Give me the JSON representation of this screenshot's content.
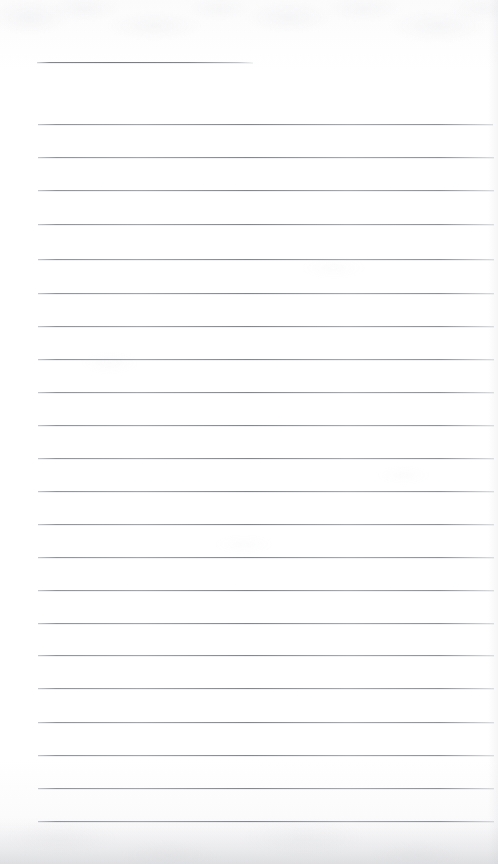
{
  "page": {
    "title": "Blank Lined Notebook Page",
    "kind": "scanned-document",
    "width": 498,
    "height": 864,
    "background_color": "#fefefe",
    "rule_color": "#84888f",
    "shadow_color": "#c4c6cb",
    "text_content": "",
    "note": "Blank ruled page. No written text, headings, numbers, or annotations are visible."
  },
  "layout": {
    "left_margin_x": 38,
    "right_margin_x": 493,
    "line_spacing": 33.2
  },
  "rules": [
    {
      "name": "header-rule",
      "y": 62,
      "x_start": 37,
      "x_end": 253,
      "full_width": false
    },
    {
      "name": "rule-01",
      "y": 124,
      "x_start": 38,
      "x_end": 493,
      "full_width": true
    },
    {
      "name": "rule-02",
      "y": 157,
      "x_start": 38,
      "x_end": 494,
      "full_width": true
    },
    {
      "name": "rule-03",
      "y": 190,
      "x_start": 38,
      "x_end": 494,
      "full_width": true
    },
    {
      "name": "rule-04",
      "y": 224,
      "x_start": 38,
      "x_end": 494,
      "full_width": true
    },
    {
      "name": "rule-05",
      "y": 259,
      "x_start": 38,
      "x_end": 494,
      "full_width": true
    },
    {
      "name": "rule-06",
      "y": 293,
      "x_start": 38,
      "x_end": 494,
      "full_width": true
    },
    {
      "name": "rule-07",
      "y": 326,
      "x_start": 38,
      "x_end": 494,
      "full_width": true
    },
    {
      "name": "rule-08",
      "y": 359,
      "x_start": 38,
      "x_end": 494,
      "full_width": true
    },
    {
      "name": "rule-09",
      "y": 392,
      "x_start": 38,
      "x_end": 494,
      "full_width": true
    },
    {
      "name": "rule-10",
      "y": 425,
      "x_start": 38,
      "x_end": 494,
      "full_width": true
    },
    {
      "name": "rule-11",
      "y": 458,
      "x_start": 38,
      "x_end": 494,
      "full_width": true
    },
    {
      "name": "rule-12",
      "y": 491,
      "x_start": 38,
      "x_end": 494,
      "full_width": true
    },
    {
      "name": "rule-13",
      "y": 524,
      "x_start": 38,
      "x_end": 494,
      "full_width": true
    },
    {
      "name": "rule-14",
      "y": 557,
      "x_start": 38,
      "x_end": 494,
      "full_width": true
    },
    {
      "name": "rule-15",
      "y": 590,
      "x_start": 38,
      "x_end": 494,
      "full_width": true
    },
    {
      "name": "rule-16",
      "y": 623,
      "x_start": 38,
      "x_end": 494,
      "full_width": true
    },
    {
      "name": "rule-17",
      "y": 655,
      "x_start": 38,
      "x_end": 494,
      "full_width": true
    },
    {
      "name": "rule-18",
      "y": 688,
      "x_start": 38,
      "x_end": 494,
      "full_width": true
    },
    {
      "name": "rule-19",
      "y": 722,
      "x_start": 38,
      "x_end": 494,
      "full_width": true
    },
    {
      "name": "rule-20",
      "y": 755,
      "x_start": 38,
      "x_end": 494,
      "full_width": true
    },
    {
      "name": "rule-21",
      "y": 788,
      "x_start": 38,
      "x_end": 494,
      "full_width": true
    },
    {
      "name": "rule-22",
      "y": 821,
      "x_start": 38,
      "x_end": 494,
      "full_width": true
    }
  ]
}
